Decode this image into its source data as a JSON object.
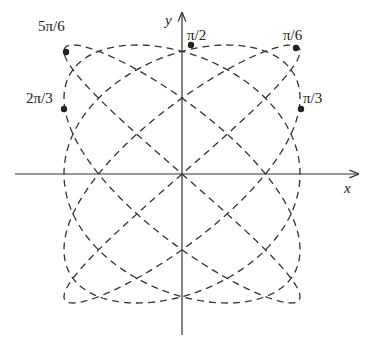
{
  "figure": {
    "axes": {
      "x_label": "x",
      "y_label": "y",
      "origin_px": [
        182,
        174
      ],
      "x_axis_px": [
        15,
        358
      ],
      "y_axis_px": [
        335,
        13
      ]
    },
    "curve": {
      "type": "parametric-lissajous",
      "style": "dashed",
      "color": "#333333",
      "x_freq": 5,
      "y_freq": 4,
      "x_phase": 0.785,
      "y_phase": 0,
      "half_width_px": 118,
      "half_height_px": 129
    },
    "points": [
      {
        "label": "5π/6",
        "x": 66,
        "y": 52,
        "label_x": 50,
        "label_y": 30
      },
      {
        "label": "2π/3",
        "x": 64,
        "y": 109,
        "label_x": 36,
        "label_y": 102
      },
      {
        "label": "π/2",
        "x": 191,
        "y": 45,
        "label_x": 189,
        "label_y": 38
      },
      {
        "label": "π/6",
        "x": 296,
        "y": 48,
        "label_x": 284,
        "label_y": 38
      },
      {
        "label": "π/3",
        "x": 301,
        "y": 109,
        "label_x": 304,
        "label_y": 102
      }
    ],
    "labels": {
      "p0": "5π/6",
      "p1": "2π/3",
      "p2": "π/2",
      "p3": "π/6",
      "p4": "π/3"
    }
  }
}
